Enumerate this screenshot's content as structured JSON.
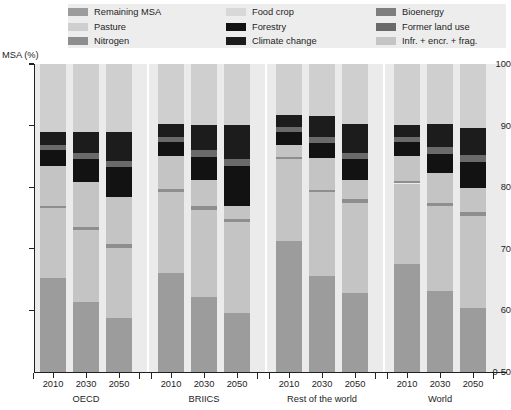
{
  "axis_title": "MSA (%)",
  "legend": {
    "items": [
      {
        "label": "Remaining MSA",
        "color": "#9c9c9c"
      },
      {
        "label": "Food crop",
        "color": "#d8d8d8"
      },
      {
        "label": "Bioenergy",
        "color": "#7e7e7e"
      },
      {
        "label": "Pasture",
        "color": "#cfcfcf"
      },
      {
        "label": "Forestry",
        "color": "#121212"
      },
      {
        "label": "Former land use",
        "color": "#6a6a6a"
      },
      {
        "label": "Nitrogen",
        "color": "#8e8e8e"
      },
      {
        "label": "Climate change",
        "color": "#1c1c1c"
      },
      {
        "label": "Infr. + encr. + frag.",
        "color": "#c4c4c4"
      }
    ]
  },
  "chart_data": {
    "type": "bar",
    "subtype": "stacked",
    "title": "",
    "xlabel": "",
    "ylabel": "MSA (%)",
    "ylim": [
      50,
      100
    ],
    "y_axis_broken": true,
    "y_ticks": [
      "0-50",
      "60",
      "70",
      "80",
      "90",
      "100"
    ],
    "y_tick_values": [
      50,
      60,
      70,
      80,
      90,
      100
    ],
    "grid": false,
    "legend_position": "top",
    "series_order": [
      "Remaining MSA",
      "Infr. + encr. + frag.",
      "Nitrogen",
      "Former land use",
      "Climate change",
      "Bioenergy",
      "Forestry",
      "Food crop",
      "Pasture"
    ],
    "series_colors": {
      "Remaining MSA": "#9c9c9c",
      "Infr. + encr. + frag.": "#c4c4c4",
      "Nitrogen": "#8e8e8e",
      "Former land use": "#6a6a6a",
      "Climate change": "#1c1c1c",
      "Bioenergy": "#7e7e7e",
      "Forestry": "#121212",
      "Food crop": "#d8d8d8",
      "Pasture": "#cfcfcf"
    },
    "groups": [
      {
        "name": "OECD",
        "bars": [
          {
            "year": "2010",
            "stack": [
              {
                "name": "Remaining MSA",
                "from": 50.0,
                "to": 65.2
              },
              {
                "name": "Infr. + encr. + frag.",
                "from": 65.2,
                "to": 76.6
              },
              {
                "name": "Nitrogen",
                "from": 76.6,
                "to": 77.0
              },
              {
                "name": "Infr. + encr. + frag.",
                "from": 77.0,
                "to": 83.4
              },
              {
                "name": "Forestry",
                "from": 83.4,
                "to": 86.0
              },
              {
                "name": "Former land use",
                "from": 86.0,
                "to": 86.8
              },
              {
                "name": "Climate change",
                "from": 86.8,
                "to": 88.9
              },
              {
                "name": "Pasture",
                "from": 88.9,
                "to": 100.0
              }
            ]
          },
          {
            "year": "2030",
            "stack": [
              {
                "name": "Remaining MSA",
                "from": 50.0,
                "to": 61.4
              },
              {
                "name": "Infr. + encr. + frag.",
                "from": 61.4,
                "to": 73.1
              },
              {
                "name": "Nitrogen",
                "from": 73.1,
                "to": 73.5
              },
              {
                "name": "Infr. + encr. + frag.",
                "from": 73.5,
                "to": 80.8
              },
              {
                "name": "Forestry",
                "from": 80.8,
                "to": 84.6
              },
              {
                "name": "Former land use",
                "from": 84.6,
                "to": 85.6
              },
              {
                "name": "Climate change",
                "from": 85.6,
                "to": 88.9
              },
              {
                "name": "Pasture",
                "from": 88.9,
                "to": 100.0
              }
            ]
          },
          {
            "year": "2050",
            "stack": [
              {
                "name": "Remaining MSA",
                "from": 50.0,
                "to": 58.7
              },
              {
                "name": "Infr. + encr. + frag.",
                "from": 58.7,
                "to": 70.2
              },
              {
                "name": "Nitrogen",
                "from": 70.2,
                "to": 70.8
              },
              {
                "name": "Infr. + encr. + frag.",
                "from": 70.8,
                "to": 78.4
              },
              {
                "name": "Forestry",
                "from": 78.4,
                "to": 83.3
              },
              {
                "name": "Former land use",
                "from": 83.3,
                "to": 84.3
              },
              {
                "name": "Climate change",
                "from": 84.3,
                "to": 89.0
              },
              {
                "name": "Pasture",
                "from": 89.0,
                "to": 100.0
              }
            ]
          }
        ]
      },
      {
        "name": "BRIICS",
        "bars": [
          {
            "year": "2010",
            "stack": [
              {
                "name": "Remaining MSA",
                "from": 50.0,
                "to": 66.1
              },
              {
                "name": "Infr. + encr. + frag.",
                "from": 66.1,
                "to": 79.3
              },
              {
                "name": "Nitrogen",
                "from": 79.3,
                "to": 79.7
              },
              {
                "name": "Infr. + encr. + frag.",
                "from": 79.7,
                "to": 85.1
              },
              {
                "name": "Forestry",
                "from": 85.1,
                "to": 87.4
              },
              {
                "name": "Former land use",
                "from": 87.4,
                "to": 88.2
              },
              {
                "name": "Climate change",
                "from": 88.2,
                "to": 90.2
              },
              {
                "name": "Pasture",
                "from": 90.2,
                "to": 100.0
              }
            ]
          },
          {
            "year": "2030",
            "stack": [
              {
                "name": "Remaining MSA",
                "from": 50.0,
                "to": 62.1
              },
              {
                "name": "Infr. + encr. + frag.",
                "from": 62.1,
                "to": 76.3
              },
              {
                "name": "Nitrogen",
                "from": 76.3,
                "to": 76.9
              },
              {
                "name": "Infr. + encr. + frag.",
                "from": 76.9,
                "to": 81.2
              },
              {
                "name": "Forestry",
                "from": 81.2,
                "to": 84.9
              },
              {
                "name": "Former land use",
                "from": 84.9,
                "to": 86.0
              },
              {
                "name": "Climate change",
                "from": 86.0,
                "to": 90.1
              },
              {
                "name": "Pasture",
                "from": 90.1,
                "to": 100.0
              }
            ]
          },
          {
            "year": "2050",
            "stack": [
              {
                "name": "Remaining MSA",
                "from": 50.0,
                "to": 59.6
              },
              {
                "name": "Infr. + encr. + frag.",
                "from": 59.6,
                "to": 74.3
              },
              {
                "name": "Nitrogen",
                "from": 74.3,
                "to": 74.9
              },
              {
                "name": "Infr. + encr. + frag.",
                "from": 74.9,
                "to": 76.9
              },
              {
                "name": "Forestry",
                "from": 76.9,
                "to": 83.4
              },
              {
                "name": "Former land use",
                "from": 83.4,
                "to": 84.6
              },
              {
                "name": "Climate change",
                "from": 84.6,
                "to": 90.1
              },
              {
                "name": "Pasture",
                "from": 90.1,
                "to": 100.0
              }
            ]
          }
        ]
      },
      {
        "name": "Rest of the world",
        "bars": [
          {
            "year": "2010",
            "stack": [
              {
                "name": "Remaining MSA",
                "from": 50.0,
                "to": 71.2
              },
              {
                "name": "Infr. + encr. + frag.",
                "from": 71.2,
                "to": 84.5
              },
              {
                "name": "Nitrogen",
                "from": 84.5,
                "to": 84.9
              },
              {
                "name": "Infr. + encr. + frag.",
                "from": 84.9,
                "to": 86.9
              },
              {
                "name": "Forestry",
                "from": 86.9,
                "to": 89.0
              },
              {
                "name": "Former land use",
                "from": 89.0,
                "to": 89.8
              },
              {
                "name": "Climate change",
                "from": 89.8,
                "to": 91.8
              },
              {
                "name": "Pasture",
                "from": 91.8,
                "to": 100.0
              }
            ]
          },
          {
            "year": "2030",
            "stack": [
              {
                "name": "Remaining MSA",
                "from": 50.0,
                "to": 65.6
              },
              {
                "name": "Infr. + encr. + frag.",
                "from": 65.6,
                "to": 79.2
              },
              {
                "name": "Nitrogen",
                "from": 79.2,
                "to": 79.6
              },
              {
                "name": "Infr. + encr. + frag.",
                "from": 79.6,
                "to": 84.8
              },
              {
                "name": "Forestry",
                "from": 84.8,
                "to": 87.1
              },
              {
                "name": "Former land use",
                "from": 87.1,
                "to": 88.1
              },
              {
                "name": "Climate change",
                "from": 88.1,
                "to": 91.5
              },
              {
                "name": "Pasture",
                "from": 91.5,
                "to": 100.0
              }
            ]
          },
          {
            "year": "2050",
            "stack": [
              {
                "name": "Remaining MSA",
                "from": 50.0,
                "to": 62.9
              },
              {
                "name": "Infr. + encr. + frag.",
                "from": 62.9,
                "to": 77.5
              },
              {
                "name": "Nitrogen",
                "from": 77.5,
                "to": 78.1
              },
              {
                "name": "Infr. + encr. + frag.",
                "from": 78.1,
                "to": 81.2
              },
              {
                "name": "Forestry",
                "from": 81.2,
                "to": 84.5
              },
              {
                "name": "Former land use",
                "from": 84.5,
                "to": 85.6
              },
              {
                "name": "Climate change",
                "from": 85.6,
                "to": 90.2
              },
              {
                "name": "Pasture",
                "from": 90.2,
                "to": 100.0
              }
            ]
          }
        ]
      },
      {
        "name": "World",
        "bars": [
          {
            "year": "2010",
            "stack": [
              {
                "name": "Remaining MSA",
                "from": 50.0,
                "to": 67.5
              },
              {
                "name": "Infr. + encr. + frag.",
                "from": 67.5,
                "to": 80.6
              },
              {
                "name": "Nitrogen",
                "from": 80.6,
                "to": 81.0
              },
              {
                "name": "Infr. + encr. + frag.",
                "from": 81.0,
                "to": 85.1
              },
              {
                "name": "Forestry",
                "from": 85.1,
                "to": 87.3
              },
              {
                "name": "Former land use",
                "from": 87.3,
                "to": 88.1
              },
              {
                "name": "Climate change",
                "from": 88.1,
                "to": 90.1
              },
              {
                "name": "Pasture",
                "from": 90.1,
                "to": 100.0
              }
            ]
          },
          {
            "year": "2030",
            "stack": [
              {
                "name": "Remaining MSA",
                "from": 50.0,
                "to": 63.1
              },
              {
                "name": "Infr. + encr. + frag.",
                "from": 63.1,
                "to": 77.0
              },
              {
                "name": "Nitrogen",
                "from": 77.0,
                "to": 77.5
              },
              {
                "name": "Infr. + encr. + frag.",
                "from": 77.5,
                "to": 82.3
              },
              {
                "name": "Forestry",
                "from": 82.3,
                "to": 85.4
              },
              {
                "name": "Former land use",
                "from": 85.4,
                "to": 86.5
              },
              {
                "name": "Climate change",
                "from": 86.5,
                "to": 90.2
              },
              {
                "name": "Pasture",
                "from": 90.2,
                "to": 100.0
              }
            ]
          },
          {
            "year": "2050",
            "stack": [
              {
                "name": "Remaining MSA",
                "from": 50.0,
                "to": 60.4
              },
              {
                "name": "Infr. + encr. + frag.",
                "from": 60.4,
                "to": 75.3
              },
              {
                "name": "Nitrogen",
                "from": 75.3,
                "to": 75.9
              },
              {
                "name": "Infr. + encr. + frag.",
                "from": 75.9,
                "to": 79.9
              },
              {
                "name": "Forestry",
                "from": 79.9,
                "to": 84.1
              },
              {
                "name": "Former land use",
                "from": 84.1,
                "to": 85.2
              },
              {
                "name": "Climate change",
                "from": 85.2,
                "to": 89.6
              },
              {
                "name": "Pasture",
                "from": 89.6,
                "to": 100.0
              }
            ]
          }
        ]
      }
    ]
  }
}
